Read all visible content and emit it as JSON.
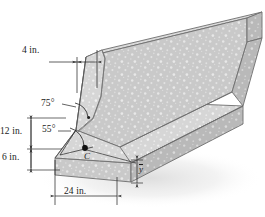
{
  "figure": {
    "name": "concrete-jersey-barrier-cross-section",
    "view": "isometric",
    "object": "concrete highway median barrier",
    "texture": "speckled aggregate concrete"
  },
  "labels": {
    "top_width": "4 in.",
    "upper_face_angle": "75°",
    "lower_face_angle": "55°",
    "upper_height": "12 in.",
    "base_height": "6 in.",
    "base_width": "24 in.",
    "centroid": "C",
    "centroid_height": "y"
  },
  "dimensions": [
    {
      "name": "top-width",
      "value": "4 in.",
      "orientation": "horizontal"
    },
    {
      "name": "upper-height",
      "value": "12 in.",
      "orientation": "vertical"
    },
    {
      "name": "base-height",
      "value": "6 in.",
      "orientation": "vertical"
    },
    {
      "name": "base-width",
      "value": "24 in.",
      "orientation": "horizontal"
    },
    {
      "name": "centroid-height",
      "value": "y",
      "orientation": "vertical"
    }
  ],
  "angles": [
    {
      "name": "upper-face-angle",
      "value": "75°"
    },
    {
      "name": "lower-face-angle",
      "value": "55°"
    }
  ],
  "colors": {
    "concrete_light": "#d2d2d2",
    "concrete_mid": "#c2c2c2",
    "concrete_dark": "#b0b0b0",
    "concrete_face": "#cccccc",
    "outline": "#5a5a5a",
    "dimension_line": "#2b2b2b",
    "text": "#1a1a1a",
    "shadow": "#e9e9e9",
    "background": "#ffffff"
  }
}
